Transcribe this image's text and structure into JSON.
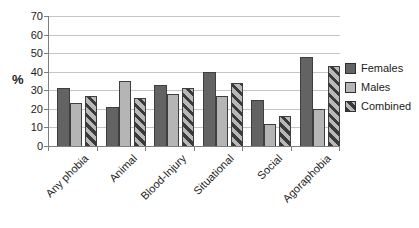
{
  "chart_data": {
    "type": "bar",
    "title": "",
    "xlabel": "",
    "ylabel": "%",
    "categories": [
      "Any phobia",
      "Animal",
      "Blood-Injury",
      "Situational",
      "Social",
      "Agoraphobia"
    ],
    "series": [
      {
        "name": "Females",
        "values": [
          31,
          21,
          33,
          40,
          25,
          48
        ],
        "color": "#636363"
      },
      {
        "name": "Males",
        "values": [
          23,
          35,
          28,
          27,
          12,
          20
        ],
        "color": "#b5b5b5"
      },
      {
        "name": "Combined",
        "values": [
          27,
          26,
          31,
          34,
          16,
          43
        ],
        "color": "#b8b8b8",
        "pattern": "diagonal-stripe",
        "stripe_color": "#3a3a3a"
      }
    ],
    "ylim": [
      0,
      70
    ],
    "ytick_step": 10,
    "yticks": [
      0,
      10,
      20,
      30,
      40,
      50,
      60,
      70
    ],
    "grid": true,
    "legend_position": "right",
    "colors": {
      "gridline": "#c4c4c4",
      "axis": "#7e7e7e",
      "text": "#1c1c1c"
    }
  }
}
